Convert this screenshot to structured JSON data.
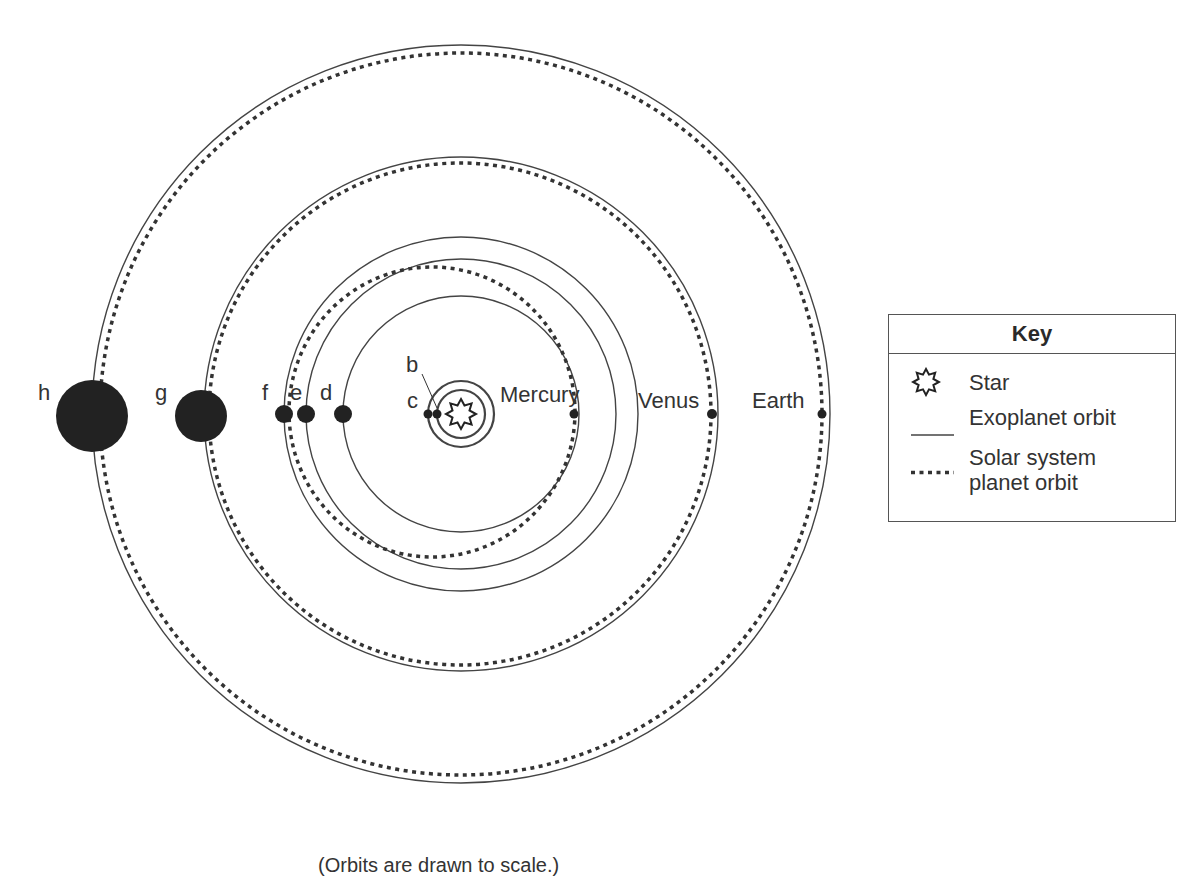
{
  "diagram": {
    "caption": "(Orbits are drawn to scale.)",
    "star": {
      "name": "star",
      "cx": 461,
      "cy": 414
    },
    "exoplanets": [
      {
        "label": "b",
        "orbit_radius_px": 24,
        "planet_radius_px": 4
      },
      {
        "label": "c",
        "orbit_radius_px": 33,
        "planet_radius_px": 4
      },
      {
        "label": "d",
        "orbit_radius_px": 118,
        "planet_radius_px": 9
      },
      {
        "label": "e",
        "orbit_radius_px": 155,
        "planet_radius_px": 9
      },
      {
        "label": "f",
        "orbit_radius_px": 177,
        "planet_radius_px": 9
      },
      {
        "label": "g",
        "orbit_radius_px": 257,
        "planet_radius_px": 26
      },
      {
        "label": "h",
        "orbit_radius_px": 369,
        "planet_radius_px": 36
      }
    ],
    "solar_system_planets": [
      {
        "label": "Mercury",
        "orbit": "eccentric dotted ellipse"
      },
      {
        "label": "Venus",
        "orbit": "dotted circle"
      },
      {
        "label": "Earth",
        "orbit": "dotted circle"
      }
    ]
  },
  "key": {
    "title": "Key",
    "items": [
      {
        "symbol": "star-icon",
        "label": "Star"
      },
      {
        "symbol": "solid-line",
        "label": "Exoplanet orbit"
      },
      {
        "symbol": "dotted-line",
        "label_line1": "Solar system",
        "label_line2": "planet orbit"
      }
    ]
  },
  "colors": {
    "line": "#444444",
    "planet": "#222222",
    "text": "#333333",
    "background": "#ffffff"
  }
}
